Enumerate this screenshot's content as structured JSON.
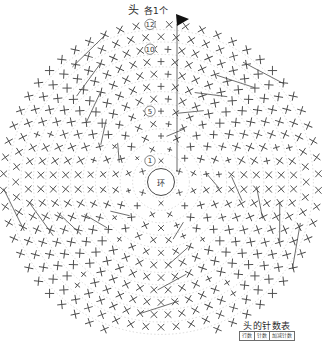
{
  "header": {
    "title": "头",
    "quantity": "各1个"
  },
  "chart_data": {
    "type": "diagram",
    "title": "头",
    "subtitle": "各1个",
    "notation": "crochet-chart",
    "center_label": "环",
    "start_marker": "arrow",
    "round_labels": [
      "①",
      "⑤",
      "⑩",
      "⑫"
    ],
    "round_label_positions": [
      1,
      5,
      10,
      12
    ],
    "total_rounds": 12,
    "guide_rings": 12,
    "symbols": [
      {
        "name": "single-crochet",
        "glyph": "X",
        "meaning": "短针"
      },
      {
        "name": "increase",
        "glyph": "+",
        "meaning": "加针"
      },
      {
        "name": "chain",
        "glyph": "bar",
        "meaning": "锁针"
      }
    ],
    "segments": 5,
    "stitch_counts": [
      6,
      12,
      18,
      24,
      30,
      36,
      42,
      48,
      54,
      60,
      60,
      60
    ]
  },
  "legend": {
    "table_title": "头的针数表",
    "columns": [
      "行数",
      "针数",
      "加减针数"
    ],
    "rows": [
      [
        "12",
        "60",
        "-"
      ],
      [
        "11",
        "60",
        "-"
      ],
      [
        "10",
        "60",
        "+6"
      ],
      [
        "9",
        "54",
        "+6"
      ],
      [
        "8",
        "48",
        "+6"
      ],
      [
        "7",
        "42",
        "+6"
      ],
      [
        "6",
        "36",
        "+6"
      ],
      [
        "5",
        "30",
        "+6"
      ],
      [
        "4",
        "24",
        "+6"
      ],
      [
        "3",
        "18",
        "+6"
      ],
      [
        "2",
        "12",
        "+6"
      ],
      [
        "1",
        "6",
        "环"
      ]
    ]
  },
  "colors": {
    "stitch": "#4a4a4a",
    "guide": "#c9c9c9",
    "text": "#2b2b2b",
    "marker": "#000000"
  }
}
